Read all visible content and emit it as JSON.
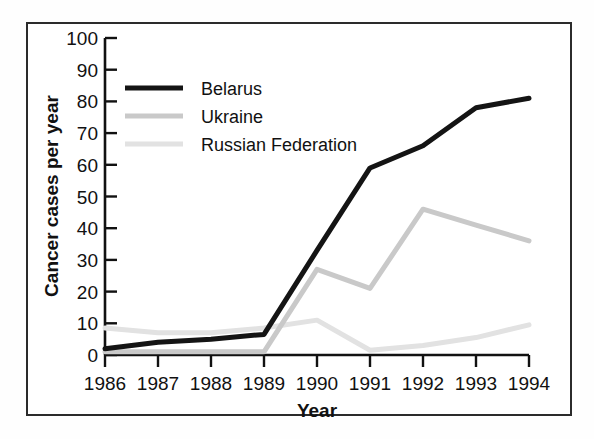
{
  "chart_data": {
    "type": "line",
    "title": "",
    "xlabel": "Year",
    "ylabel": "Cancer cases per year",
    "categories": [
      "1986",
      "1987",
      "1988",
      "1989",
      "1990",
      "1991",
      "1992",
      "1993",
      "1994"
    ],
    "x": [
      1986,
      1987,
      1988,
      1989,
      1990,
      1991,
      1992,
      1993,
      1994
    ],
    "xlim": [
      1986,
      1994
    ],
    "ylim": [
      0,
      100
    ],
    "yticks": [
      0,
      10,
      20,
      30,
      40,
      50,
      60,
      70,
      80,
      90,
      100
    ],
    "ytick_labels": [
      "0",
      "10",
      "20",
      "30",
      "40",
      "50",
      "60",
      "70",
      "80",
      "90",
      "100"
    ],
    "xtick_labels": [
      "1986",
      "1987",
      "1988",
      "1989",
      "1990",
      "1991",
      "1992",
      "1993",
      "1994"
    ],
    "grid": false,
    "legend_position": "upper left",
    "series": [
      {
        "name": "Belarus",
        "color": "#141414",
        "width": 5,
        "values": [
          2,
          4,
          5,
          6.5,
          33,
          59,
          66,
          78,
          81
        ]
      },
      {
        "name": "Ukraine",
        "color": "#c9c9c9",
        "width": 5,
        "values": [
          1,
          1,
          1,
          1,
          27,
          21,
          46,
          41,
          36
        ]
      },
      {
        "name": "Russian Federation",
        "color": "#e2e2e2",
        "width": 5,
        "values": [
          8.5,
          7,
          7,
          8.5,
          11,
          1.5,
          3,
          5.5,
          9.5
        ]
      }
    ]
  },
  "legend": {
    "items": [
      {
        "label": "Belarus"
      },
      {
        "label": "Ukraine"
      },
      {
        "label": "Russian Federation"
      }
    ]
  },
  "axes": {
    "y_title": "Cancer cases per year",
    "x_title": "Year"
  }
}
